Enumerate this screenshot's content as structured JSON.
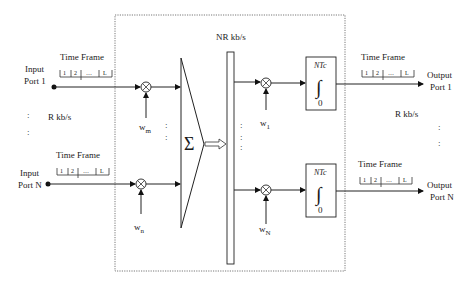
{
  "diagram": {
    "inputs": [
      {
        "label_line1": "Input",
        "label_line2": "Port 1",
        "frame_label": "Time Frame",
        "slots": [
          "1",
          "2",
          "…",
          "L"
        ],
        "weight": "w",
        "weight_sub": "m"
      },
      {
        "label_line1": "Input",
        "label_line2": "Port N",
        "frame_label": "Time Frame",
        "slots": [
          "1",
          "2",
          "…",
          "L"
        ],
        "weight": "w",
        "weight_sub": "n"
      }
    ],
    "input_rate": "R kb/s",
    "summer_symbol": "Σ",
    "bus_rate": "NR kb/s",
    "outputs": [
      {
        "label_line1": "Output",
        "label_line2": "Port 1",
        "frame_label": "Time Frame",
        "slots": [
          "1",
          "2",
          "…",
          "L"
        ],
        "weight": "w",
        "weight_sub": "1",
        "integrator_upper": "NTc",
        "integrator_lower": "0",
        "integrator_symbol": "∫"
      },
      {
        "label_line1": "Output",
        "label_line2": "Port N",
        "frame_label": "Time Frame",
        "slots": [
          "1",
          "2",
          "…",
          "L"
        ],
        "weight": "w",
        "weight_sub": "N",
        "integrator_upper": "NTc",
        "integrator_lower": "0",
        "integrator_symbol": "∫"
      }
    ],
    "output_rate": "R kb/s",
    "ellipsis_vertical": ":"
  }
}
